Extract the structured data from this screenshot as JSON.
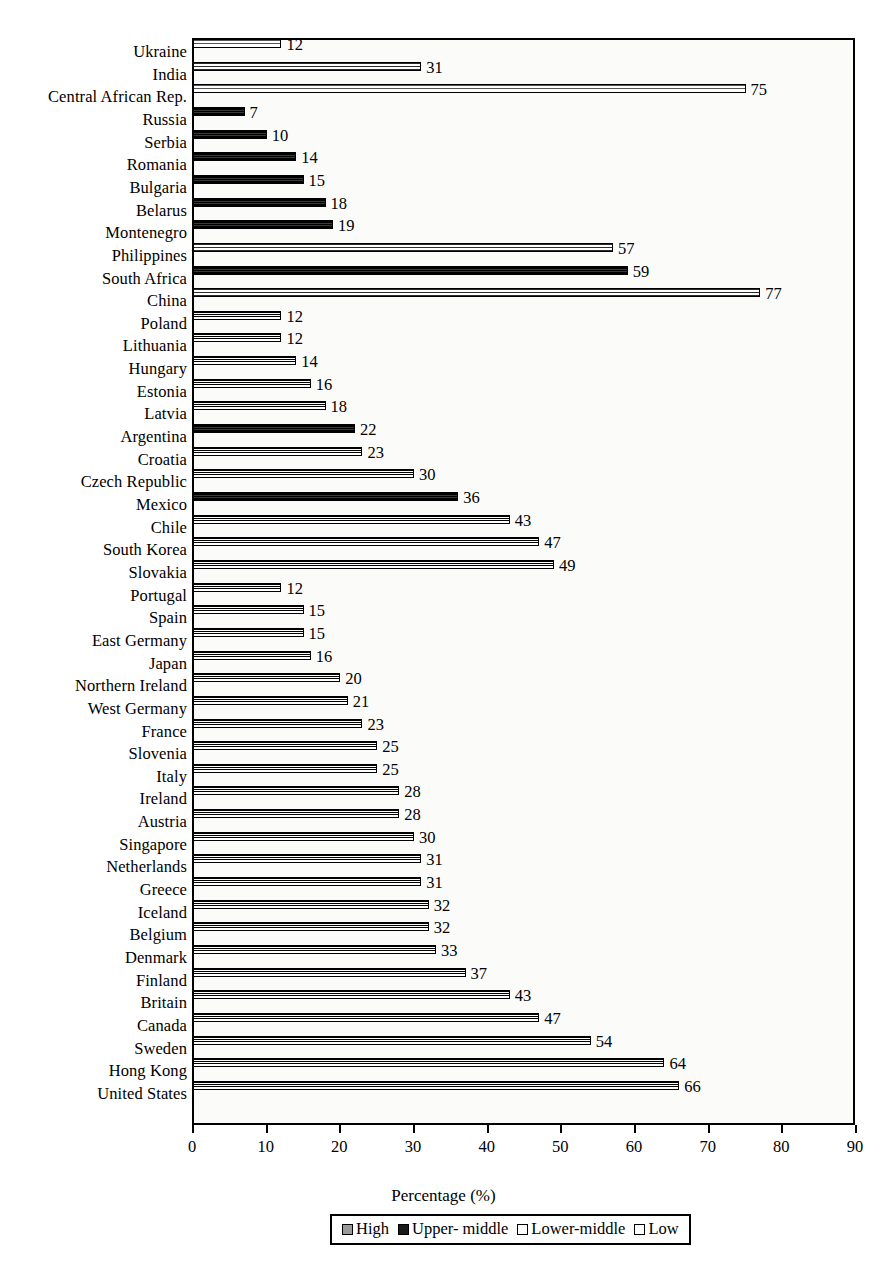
{
  "chart_data": {
    "type": "bar",
    "orientation": "horizontal",
    "title": "",
    "xlabel": "Percentage (%)",
    "ylabel": "",
    "xlim": [
      0,
      90
    ],
    "xticks": [
      0,
      10,
      20,
      30,
      40,
      50,
      60,
      70,
      80,
      90
    ],
    "grid": false,
    "legend_position": "bottom",
    "legend": [
      "High",
      "Upper- middle",
      "Lower-middle",
      "Low"
    ],
    "categories": [
      "Ukraine",
      "India",
      "Central African Rep.",
      "Russia",
      "Serbia",
      "Romania",
      "Bulgaria",
      "Belarus",
      "Montenegro",
      "Philippines",
      "South Africa",
      "China",
      "Poland",
      "Lithuania",
      "Hungary",
      "Estonia",
      "Latvia",
      "Argentina",
      "Croatia",
      "Czech Republic",
      "Mexico",
      "Chile",
      "South Korea",
      "Slovakia",
      "Portugal",
      "Spain",
      "East Germany",
      "Japan",
      "Northern Ireland",
      "West Germany",
      "France",
      "Slovenia",
      "Italy",
      "Ireland",
      "Austria",
      "Singapore",
      "Netherlands",
      "Greece",
      "Iceland",
      "Belgium",
      "Denmark",
      "Finland",
      "Britain",
      "Canada",
      "Sweden",
      "Hong Kong",
      "United States"
    ],
    "values": [
      12,
      31,
      75,
      7,
      10,
      14,
      15,
      18,
      19,
      57,
      59,
      77,
      12,
      12,
      14,
      16,
      18,
      22,
      23,
      30,
      36,
      43,
      47,
      49,
      12,
      15,
      15,
      16,
      20,
      21,
      23,
      25,
      25,
      28,
      28,
      30,
      31,
      31,
      32,
      32,
      33,
      37,
      43,
      47,
      54,
      64,
      66
    ],
    "groups": [
      "low",
      "lower",
      "low",
      "upper",
      "upper",
      "upper",
      "upper",
      "upper",
      "upper",
      "lower",
      "upper",
      "lower",
      "high",
      "high",
      "high",
      "high",
      "high",
      "upper",
      "high",
      "high",
      "upper",
      "high",
      "high",
      "high",
      "high",
      "high",
      "high",
      "high",
      "high",
      "high",
      "high",
      "high",
      "high",
      "high",
      "high",
      "high",
      "high",
      "high",
      "high",
      "high",
      "high",
      "high",
      "high",
      "high",
      "high",
      "high",
      "high"
    ]
  },
  "colors": {
    "axis": "#000000",
    "plot_background": "#fbfbf9",
    "bar_outline": "#000000",
    "high": "#9a9a9a",
    "upper_middle": "#1a1a1a",
    "lower_middle": "#ffffff",
    "low": "#ffffff"
  }
}
